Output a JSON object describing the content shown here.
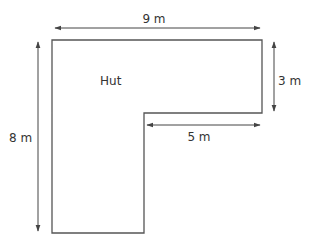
{
  "diagram": {
    "shape_label": "Hut",
    "shape": "L-shaped floor plan",
    "dimensions": {
      "top_width": "9 m",
      "right_height": "3 m",
      "inner_width": "5 m",
      "left_height": "8 m"
    },
    "colors": {
      "outline": "#555555",
      "arrow": "#444444",
      "text": "#333333"
    }
  }
}
